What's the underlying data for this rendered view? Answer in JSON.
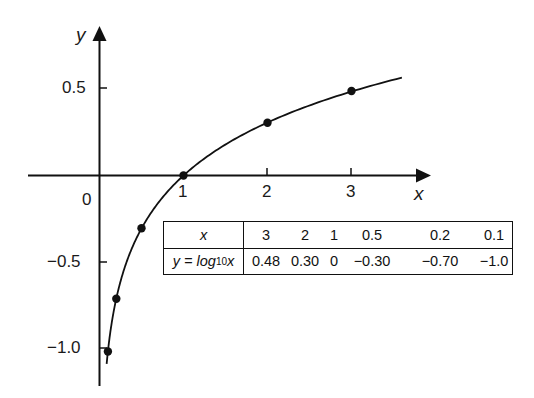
{
  "chart_data": {
    "type": "line",
    "title": "",
    "function": "y = log10(x)",
    "xlabel": "x",
    "ylabel": "y",
    "origin_label": "0",
    "x_ticks": [
      1,
      2,
      3
    ],
    "x_tick_labels": [
      "1",
      "2",
      "3"
    ],
    "y_ticks": [
      0.5,
      -0.5,
      -1.0
    ],
    "y_tick_labels": [
      "0.5",
      "−0.5",
      "−1.0"
    ],
    "xlim": [
      -0.85,
      3.9
    ],
    "ylim": [
      -1.2,
      0.85
    ],
    "grid": false,
    "legend": null,
    "series": [
      {
        "name": "y = log10 x",
        "curve_range": [
          0.085,
          3.6
        ],
        "points": [
          {
            "x": 3,
            "y": 0.48
          },
          {
            "x": 2,
            "y": 0.3
          },
          {
            "x": 1,
            "y": 0
          },
          {
            "x": 0.5,
            "y": -0.3
          },
          {
            "x": 0.2,
            "y": -0.7
          },
          {
            "x": 0.1,
            "y": -1.0
          }
        ]
      }
    ],
    "table": {
      "row_headers": [
        "x",
        "y = log10 x"
      ],
      "x_values": [
        "3",
        "2",
        "1",
        "0.5",
        "0.2",
        "0.1"
      ],
      "y_values": [
        "0.48",
        "0.30",
        "0",
        "−0.30",
        "−0.70",
        "−1.0"
      ]
    }
  },
  "labels": {
    "y_axis": "y",
    "x_axis": "x",
    "origin": "0",
    "x_tick_1": "1",
    "x_tick_2": "2",
    "x_tick_3": "3",
    "y_tick_pos05": "0.5",
    "y_tick_neg05": "−0.5",
    "y_tick_neg10": "−1.0"
  },
  "table": {
    "row0_header": "x",
    "row1_header_prefix": "y = log",
    "row1_header_sub": "10",
    "row1_header_suffix": "x",
    "x_values": [
      "3",
      "2",
      "1",
      "0.5",
      "0.2",
      "0.1"
    ],
    "y_values": [
      "0.48",
      "0.30",
      "0",
      "−0.30",
      "−0.70",
      "−1.0"
    ]
  }
}
